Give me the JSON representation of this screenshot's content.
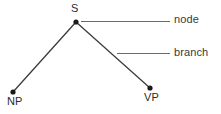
{
  "diagram": {
    "type": "syntax-tree",
    "colors": {
      "line": "#3c3c3c",
      "node_fill": "#1a1a1a",
      "text": "#2b2b2b",
      "callout_line": "#6a6a6a",
      "background": "#ffffff"
    },
    "nodes": [
      {
        "id": "S",
        "label": "S",
        "x": 76,
        "y": 22,
        "radius": 2.6
      },
      {
        "id": "NP",
        "label": "NP",
        "x": 13,
        "y": 92,
        "radius": 2.6
      },
      {
        "id": "VP",
        "label": "VP",
        "x": 150,
        "y": 88,
        "radius": 2.6
      }
    ],
    "branches": [
      {
        "id": "S-NP",
        "from": "S",
        "to": "NP",
        "x1": 76,
        "y1": 22,
        "x2": 13,
        "y2": 92
      },
      {
        "id": "S-VP",
        "from": "S",
        "to": "VP",
        "x1": 76,
        "y1": 22,
        "x2": 150,
        "y2": 88
      }
    ],
    "callouts": [
      {
        "id": "node-callout",
        "label": "node",
        "target": "S",
        "leader": {
          "x1": 81,
          "y1": 21,
          "x2": 170,
          "y2": 21
        }
      },
      {
        "id": "branch-callout",
        "label": "branch",
        "target": "S-VP",
        "leader": {
          "x1": 117,
          "y1": 53,
          "x2": 170,
          "y2": 53
        }
      }
    ]
  }
}
